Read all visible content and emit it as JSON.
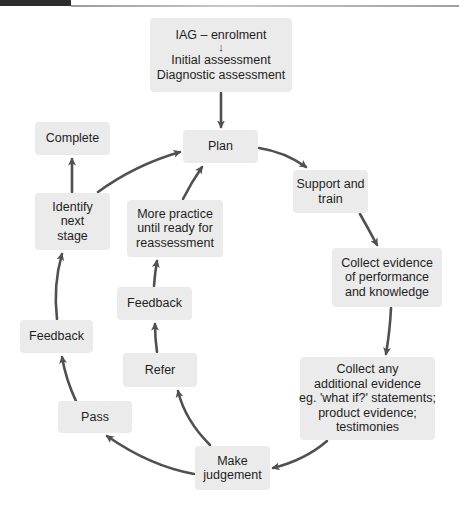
{
  "figure": {
    "header": {
      "tab_color": "#2d2d2d",
      "rule_color": "#a0a0a0"
    },
    "colors": {
      "box_fill": "#ebebeb",
      "arrow": "#505050",
      "text": "#1e1e1e"
    },
    "nodes": {
      "entry": {
        "line1": "IAG – enrolment",
        "inner_arrow": "↓",
        "line2": "Initial assessment",
        "line3": "Diagnostic assessment"
      },
      "plan": {
        "lines": [
          "Plan"
        ]
      },
      "support": {
        "lines": [
          "Support and",
          "train"
        ]
      },
      "collect_evidence": {
        "lines": [
          "Collect evidence",
          "of performance",
          "and knowledge"
        ]
      },
      "collect_additional": {
        "lines": [
          "Collect any",
          "additional evidence",
          "eg. 'what if?' statements;",
          "product evidence;",
          "testimonies"
        ]
      },
      "judgement": {
        "lines": [
          "Make",
          "judgement"
        ]
      },
      "pass": {
        "lines": [
          "Pass"
        ]
      },
      "feedback_outer": {
        "lines": [
          "Feedback"
        ]
      },
      "identify": {
        "lines": [
          "Identify",
          "next",
          "stage"
        ]
      },
      "complete": {
        "lines": [
          "Complete"
        ]
      },
      "refer": {
        "lines": [
          "Refer"
        ]
      },
      "feedback_inner": {
        "lines": [
          "Feedback"
        ]
      },
      "more_practice": {
        "lines": [
          "More practice",
          "until ready for",
          "reassessment"
        ]
      }
    },
    "edges": [
      {
        "from": "entry",
        "to": "plan"
      },
      {
        "from": "plan",
        "to": "support"
      },
      {
        "from": "support",
        "to": "collect_evidence"
      },
      {
        "from": "collect_evidence",
        "to": "collect_additional"
      },
      {
        "from": "collect_additional",
        "to": "judgement"
      },
      {
        "from": "judgement",
        "to": "pass"
      },
      {
        "from": "pass",
        "to": "feedback_outer"
      },
      {
        "from": "feedback_outer",
        "to": "identify"
      },
      {
        "from": "identify",
        "to": "complete"
      },
      {
        "from": "identify",
        "to": "plan"
      },
      {
        "from": "judgement",
        "to": "refer"
      },
      {
        "from": "refer",
        "to": "feedback_inner"
      },
      {
        "from": "feedback_inner",
        "to": "more_practice"
      },
      {
        "from": "more_practice",
        "to": "plan"
      }
    ]
  }
}
